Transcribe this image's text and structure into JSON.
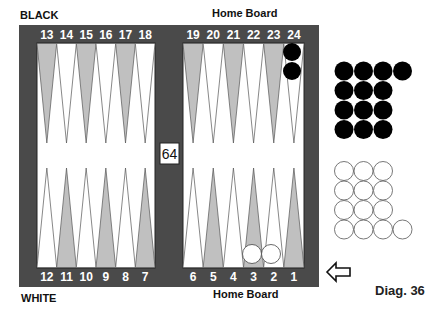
{
  "labels": {
    "top_left": "BLACK",
    "top_center": "Home Board",
    "bottom_left": "WHITE",
    "bottom_center": "Home Board",
    "diagram": "Diag. 36"
  },
  "cube": {
    "value": "64"
  },
  "points_top": [
    "13",
    "14",
    "15",
    "16",
    "17",
    "18",
    "19",
    "20",
    "21",
    "22",
    "23",
    "24"
  ],
  "points_bottom": [
    "12",
    "11",
    "10",
    "9",
    "8",
    "7",
    "6",
    "5",
    "4",
    "3",
    "2",
    "1"
  ],
  "checkers_on_board": [
    {
      "point": "24",
      "color": "black",
      "count": 2
    },
    {
      "point": "3",
      "color": "white",
      "count": 1
    },
    {
      "point": "2",
      "color": "white",
      "count": 1
    }
  ],
  "borne_off": {
    "black": {
      "count": 13,
      "rows": [
        4,
        3,
        3,
        3
      ]
    },
    "white": {
      "count": 13,
      "rows": [
        3,
        3,
        3,
        4
      ]
    }
  },
  "direction_arrow": "left-arrow",
  "colors": {
    "frame": "#4a4a4a",
    "field": "#ffffff",
    "point_shaded": "#c0c0c0",
    "point_white": "#ffffff",
    "checker_black": "#000000",
    "checker_white": "#ffffff"
  }
}
